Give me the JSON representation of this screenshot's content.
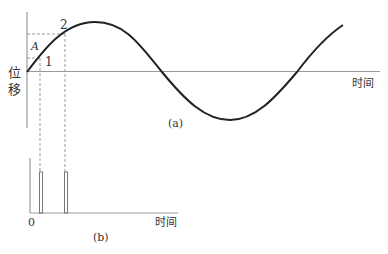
{
  "figure_a": {
    "caption": "(a)",
    "y_axis_label_line1": "位",
    "y_axis_label_line2": "移",
    "x_axis_label": "时间",
    "point_labels": {
      "p1": "1",
      "p2": "2",
      "amplitude": "A"
    },
    "curve": "sinusoid: starts at origin, rises to peak, crosses zero, trough, crosses zero, rises again"
  },
  "figure_b": {
    "caption": "(b)",
    "origin_label": "0",
    "x_axis_label": "时间",
    "pulses": [
      "pulse at time of point 1",
      "pulse at time of point 2"
    ]
  },
  "colors": {
    "curve": "#222222",
    "axis": "#888888",
    "dash": "#999999",
    "text": "#333333"
  }
}
